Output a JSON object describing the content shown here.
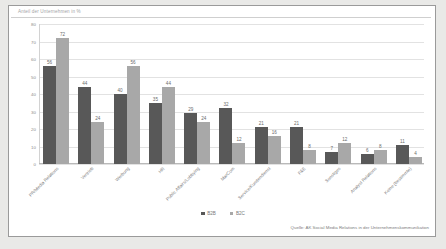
{
  "chart_title": "Anteil der Unternehmen in %",
  "legend": {
    "position": "bottom-center",
    "entries": [
      {
        "label": "B2B",
        "color": "#585858"
      },
      {
        "label": "B2C",
        "color": "#a8a8a8"
      }
    ]
  },
  "source": "Quelle: AK Social Media Relations in der Unternehmenskommunikation",
  "chart_data": {
    "type": "bar",
    "title": "Anteil der Unternehmen in %",
    "xlabel": "",
    "ylabel": "",
    "ylim": [
      0,
      80
    ],
    "yticks": [
      0,
      10,
      20,
      30,
      40,
      50,
      60,
      70,
      80
    ],
    "grid": true,
    "legend_position": "bottom-center",
    "categories": [
      "PR/Media Relations",
      "Vertrieb",
      "Werbung",
      "HR",
      "Public Affairs/Lobbying",
      "MarCom",
      "Service/Kundendienst",
      "F&E",
      "Sonstiges",
      "Analyst Relations",
      "Keine (bestimmte)"
    ],
    "series": [
      {
        "name": "B2B",
        "color": "#585858",
        "values": [
          56,
          44,
          40,
          35,
          29,
          32,
          21,
          21,
          7,
          6,
          11
        ]
      },
      {
        "name": "B2C",
        "color": "#a8a8a8",
        "values": [
          72,
          24,
          56,
          44,
          24,
          12,
          16,
          8,
          12,
          8,
          4
        ]
      }
    ]
  }
}
